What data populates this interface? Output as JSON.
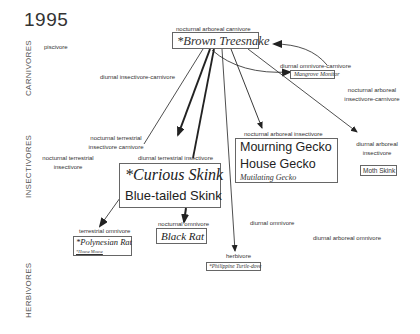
{
  "title": "1995",
  "trophic_levels": {
    "carnivores": "CARNIVORES",
    "insectivores": "INSECTIVORES",
    "herbivores": "HERBIVORES"
  },
  "niches": {
    "piscivore": "piscivore",
    "diurnal_insectivore_carnivore": "diurnal insectivore-carnivore",
    "nocturnal_arboreal_carnivore": "nocturnal arboreal carnivore",
    "diurnal_omnivore_carnivore": "diurnal omnivore-carnivore",
    "nocturnal_arboreal_insectivore_carnivore_l1": "nocturnal arboreal",
    "nocturnal_arboreal_insectivore_carnivore_l2": "insectivore-carnivore",
    "nocturnal_terrestrial_insectivore_carnivore_l1": "nocturnal terrestrial",
    "nocturnal_terrestrial_insectivore_carnivore_l2": "insectivore carnivore",
    "nocturnal_terrestrial_insectivore_l1": "nocturnal terrestrial",
    "nocturnal_terrestrial_insectivore_l2": "insectivore",
    "diurnal_terrestrial_insectivore": "diurnal terrestrial insectivore",
    "nocturnal_arboreal_insectivore": "nocturnal arboreal insectivore",
    "diurnal_arboreal_insectivore_l1": "diurnal arboreal",
    "diurnal_arboreal_insectivore_l2": "insectivore",
    "terrestrial_omnivore": "terrestrial omnivore",
    "nocturnal_omnivore": "nocturnal omnivore",
    "diurnal_omnivore": "diurnal omnivore",
    "diurnal_arboreal_omnivore": "diurnal arboreal omnivore",
    "herbivore": "herbivore"
  },
  "species": {
    "brown_treesnake": "*Brown Treesnake",
    "mangrove_monitor": "Mangrove Monitor",
    "curious_skink": "*Curious Skink",
    "blue_tailed_skink": "Blue-tailed Skink",
    "mourning_gecko": "Mourning Gecko",
    "house_gecko": "House Gecko",
    "mutilating_gecko": "Mutilating Gecko",
    "moth_skink": "Moth Skink",
    "polynesian_rat": "*Polynesian Rat",
    "house_mouse": "*House Mouse",
    "black_rat": "Black Rat",
    "philippine_turtle_dove": "*Philippine Turtle-dove"
  },
  "colors": {
    "line": "#222222",
    "box_border": "#666666",
    "text": "#333333"
  }
}
